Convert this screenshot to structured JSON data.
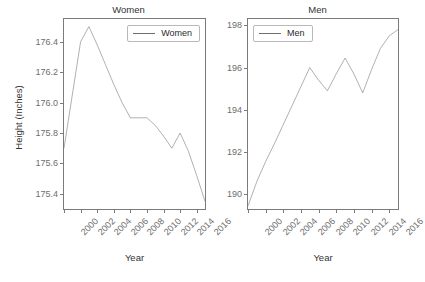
{
  "figure": {
    "y_axis_title": "Height (Inches)",
    "x_axis_title_women": "Year",
    "x_axis_title_men": "Year",
    "line_color": "#6f6f6f",
    "axis_color": "#7b7b7b",
    "tick_label_color": "#6d6d6d",
    "background": "#ffffff"
  },
  "panels": [
    {
      "key": "women",
      "title": "Women",
      "legend_label": "Women",
      "y_ticks": [
        "176.4",
        "176.2",
        "176.0",
        "175.8",
        "175.6",
        "175.4"
      ],
      "x_ticks": [
        "2000",
        "2002",
        "2004",
        "2006",
        "2008",
        "2010",
        "2012",
        "2014",
        "2016"
      ]
    },
    {
      "key": "men",
      "title": "Men",
      "legend_label": "Men",
      "y_ticks": [
        "198",
        "196",
        "194",
        "192",
        "190"
      ],
      "x_ticks": [
        "2000",
        "2002",
        "2004",
        "2006",
        "2008",
        "2010",
        "2012",
        "2014",
        "2016"
      ]
    }
  ],
  "chart_data": [
    {
      "type": "line",
      "title": "Women",
      "xlabel": "Year",
      "ylabel": "Height (Inches)",
      "legend": [
        "Women"
      ],
      "legend_position": "top-right",
      "grid": false,
      "xlim": [
        2000,
        2017
      ],
      "ylim": [
        175.3,
        176.55
      ],
      "x": [
        2000,
        2001,
        2002,
        2003,
        2004,
        2005,
        2006,
        2007,
        2008,
        2009,
        2010,
        2011,
        2012,
        2013,
        2014,
        2015,
        2016,
        2017
      ],
      "series": [
        {
          "name": "Women",
          "values": [
            175.7,
            176.05,
            176.4,
            176.5,
            176.38,
            176.25,
            176.12,
            176.0,
            175.9,
            175.9,
            175.9,
            175.85,
            175.78,
            175.7,
            175.8,
            175.68,
            175.52,
            175.35
          ]
        }
      ]
    },
    {
      "type": "line",
      "title": "Men",
      "xlabel": "Year",
      "ylabel": "Height (Inches)",
      "legend": [
        "Men"
      ],
      "legend_position": "top-left",
      "grid": false,
      "xlim": [
        2000,
        2017
      ],
      "ylim": [
        189.3,
        198.3
      ],
      "x": [
        2000,
        2001,
        2002,
        2003,
        2004,
        2005,
        2006,
        2007,
        2008,
        2009,
        2010,
        2011,
        2012,
        2013,
        2014,
        2015,
        2016,
        2017
      ],
      "series": [
        {
          "name": "Men",
          "values": [
            189.45,
            190.6,
            191.55,
            192.4,
            193.3,
            194.2,
            195.1,
            196.0,
            195.4,
            194.9,
            195.7,
            196.45,
            195.7,
            194.8,
            195.9,
            196.9,
            197.5,
            197.8
          ]
        }
      ]
    }
  ]
}
